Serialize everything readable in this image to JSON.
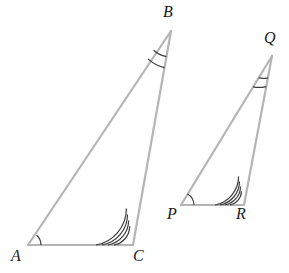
{
  "figure": {
    "type": "geometry-diagram",
    "background_color": "#ffffff",
    "side_stroke_color": "#b5b5b5",
    "side_stroke_width": 2.2,
    "arc_stroke_color": "#3c3c3c",
    "arc_stroke_width": 1.2,
    "label_color": "#1a1a1a"
  },
  "triangles": [
    {
      "name": "triangle-abc",
      "vertices": [
        {
          "label": "A",
          "x": 28,
          "y": 245,
          "label_x": 11,
          "label_y": 248,
          "marks": 1
        },
        {
          "label": "B",
          "x": 171,
          "y": 31,
          "label_x": 163,
          "label_y": 4,
          "marks": 2
        },
        {
          "label": "C",
          "x": 133,
          "y": 245,
          "label_x": 133,
          "label_y": 248,
          "marks": 4
        }
      ]
    },
    {
      "name": "triangle-pqr",
      "vertices": [
        {
          "label": "P",
          "x": 181,
          "y": 205,
          "label_x": 167,
          "label_y": 206,
          "marks": 1
        },
        {
          "label": "Q",
          "x": 272,
          "y": 56,
          "label_x": 264,
          "label_y": 30,
          "marks": 2
        },
        {
          "label": "R",
          "x": 244,
          "y": 205,
          "label_x": 236,
          "label_y": 206,
          "marks": 4
        }
      ]
    }
  ],
  "angle_marks": {
    "a": {
      "name": "angle-mark-a",
      "count": 1,
      "radii": [
        13
      ]
    },
    "b": {
      "name": "angle-mark-b",
      "count": 2,
      "radii": [
        26,
        36
      ]
    },
    "c": {
      "name": "angle-mark-c",
      "count": 4,
      "radii": [
        19,
        25,
        31,
        37
      ]
    },
    "p": {
      "name": "angle-mark-p",
      "count": 1,
      "radii": [
        13
      ]
    },
    "q": {
      "name": "angle-mark-q",
      "count": 2,
      "radii": [
        22,
        31
      ]
    },
    "r": {
      "name": "angle-mark-r",
      "count": 4,
      "radii": [
        14,
        19,
        24,
        29
      ]
    }
  }
}
